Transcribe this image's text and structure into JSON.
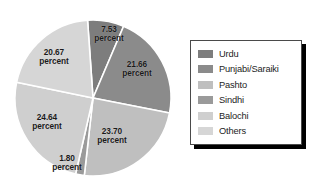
{
  "chart_data": {
    "type": "pie",
    "title": "",
    "subtitle": "",
    "xlabel": "",
    "ylabel": "",
    "grid": false,
    "legend_position": "right",
    "unit_label": "percent",
    "categories": [
      "Urdu",
      "Punjabi/Saraiki",
      "Pashto",
      "Sindhi",
      "Balochi",
      "Others"
    ],
    "values": [
      7.53,
      21.66,
      23.7,
      1.8,
      24.64,
      20.67
    ],
    "value_labels": [
      "7.53",
      "21.66",
      "23.70",
      "1.80",
      "24.64",
      "20.67"
    ],
    "colors": [
      "#7d7d7d",
      "#8b8b8b",
      "#bfbfbf",
      "#9a9a9a",
      "#cfcfcf",
      "#d6d6d6"
    ],
    "slices": [
      {
        "name": "Urdu",
        "value": 7.53,
        "label": "7.53",
        "unit": "percent",
        "color": "#7d7d7d",
        "start_angle": 0.0,
        "end_angle": 27.108,
        "label_x": 109,
        "label_y": 34
      },
      {
        "name": "Punjabi/Saraiki",
        "value": 21.66,
        "label": "21.66",
        "unit": "percent",
        "color": "#8b8b8b",
        "start_angle": 27.108,
        "end_angle": 105.084,
        "label_x": 137,
        "label_y": 69
      },
      {
        "name": "Pashto",
        "value": 23.7,
        "label": "23.70",
        "unit": "percent",
        "color": "#bfbfbf",
        "start_angle": 105.084,
        "end_angle": 190.404,
        "label_x": 112,
        "label_y": 136
      },
      {
        "name": "Sindhi",
        "value": 1.8,
        "label": "1.80",
        "unit": "percent",
        "color": "#9a9a9a",
        "start_angle": 190.404,
        "end_angle": 196.884,
        "label_x": 67,
        "label_y": 163
      },
      {
        "name": "Balochi",
        "value": 24.64,
        "label": "24.64",
        "unit": "percent",
        "color": "#cfcfcf",
        "start_angle": 196.884,
        "end_angle": 285.588,
        "label_x": 47,
        "label_y": 122
      },
      {
        "name": "Others",
        "value": 20.67,
        "label": "20.67",
        "unit": "percent",
        "color": "#d6d6d6",
        "start_angle": 285.588,
        "end_angle": 360.0,
        "label_x": 54,
        "label_y": 57
      }
    ],
    "geometry": {
      "cx": 93,
      "cy": 98,
      "r": 78,
      "rotation": -4,
      "separator_color": "#ffffff",
      "separator_width": 1.6
    }
  },
  "legend": {
    "items": [
      {
        "label": "Urdu",
        "color": "#7d7d7d"
      },
      {
        "label": "Punjabi/Saraiki",
        "color": "#8b8b8b"
      },
      {
        "label": "Pashto",
        "color": "#bfbfbf"
      },
      {
        "label": "Sindhi",
        "color": "#9a9a9a"
      },
      {
        "label": "Balochi",
        "color": "#cfcfcf"
      },
      {
        "label": "Others",
        "color": "#d6d6d6"
      }
    ]
  }
}
